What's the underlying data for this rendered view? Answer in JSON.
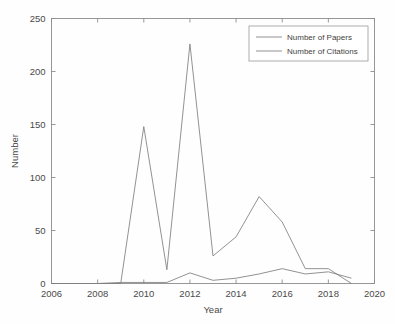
{
  "chart_data": {
    "type": "line",
    "title": "",
    "xlabel": "Year",
    "ylabel": "Number",
    "xlim": [
      2006,
      2020
    ],
    "ylim": [
      0,
      250
    ],
    "xticks": [
      2006,
      2008,
      2010,
      2012,
      2014,
      2016,
      2018,
      2020
    ],
    "xtick_labels": [
      "2006",
      "2008",
      "2010",
      "2012",
      "2014",
      "2016",
      "2018",
      "2020"
    ],
    "yticks": [
      0,
      50,
      100,
      150,
      200,
      250
    ],
    "ytick_labels": [
      "0",
      "50",
      "100",
      "150",
      "200",
      "250"
    ],
    "grid": false,
    "legend_position": "top-right",
    "x": [
      2006,
      2007,
      2008,
      2009,
      2010,
      2011,
      2012,
      2013,
      2014,
      2015,
      2016,
      2017,
      2018,
      2019
    ],
    "series": [
      {
        "name": "Number of Papers",
        "color": "#7e7e7e",
        "values": [
          0,
          0,
          0,
          1,
          1,
          1,
          10,
          3,
          5,
          9,
          14,
          9,
          11,
          5
        ]
      },
      {
        "name": "Number of Citations",
        "color": "#7e7e7e",
        "values": [
          0,
          0,
          0,
          0,
          148,
          13,
          226,
          26,
          44,
          82,
          58,
          14,
          14,
          0
        ]
      }
    ]
  },
  "legend": {
    "entries": [
      {
        "label": "Number of Papers"
      },
      {
        "label": "Number of Citations"
      }
    ]
  },
  "axes": {
    "x_title": "Year",
    "y_title": "Number"
  }
}
